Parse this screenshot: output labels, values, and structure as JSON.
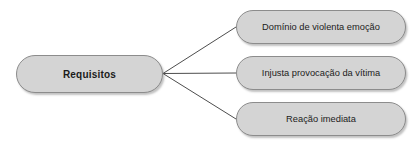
{
  "diagram": {
    "background_color": "#ffffff",
    "node_fill_color": "#d4d4d4",
    "node_border_color": "#8c8c8c",
    "connector_color": "#4d4d4d",
    "text_color": "#1b1b1b",
    "root": {
      "label": "Requisitos"
    },
    "branches": [
      {
        "label": "Domínio de violenta emoção"
      },
      {
        "label": "Injusta provocação da vítima"
      },
      {
        "label": "Reação imediata"
      }
    ]
  }
}
